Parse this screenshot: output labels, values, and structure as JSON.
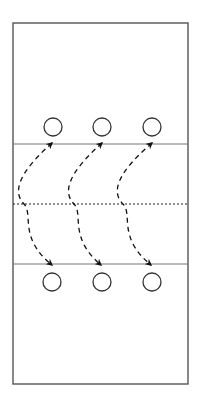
{
  "diagram": {
    "type": "volleyball-court-rotation",
    "colors": {
      "background": "#ffffff",
      "court_border": "#555555",
      "lines": "#777777",
      "net": "#222222",
      "players": "#333333",
      "arrows": "#111111"
    },
    "court": {
      "x": 13,
      "y": 23,
      "width": 175,
      "height": 361
    },
    "lines": {
      "attack_line_top_y": 144,
      "net_y": 204,
      "attack_line_bottom_y": 264
    },
    "players": {
      "radius": 9,
      "top_row": [
        {
          "cx": 53,
          "cy": 127
        },
        {
          "cx": 102,
          "cy": 127
        },
        {
          "cx": 152,
          "cy": 127
        }
      ],
      "bottom_row": [
        {
          "cx": 52,
          "cy": 282
        },
        {
          "cx": 102,
          "cy": 282
        },
        {
          "cx": 152,
          "cy": 282
        }
      ]
    },
    "arrows": [
      {
        "start": [
          52,
          143
        ],
        "bulge_x": 24,
        "end": [
          52,
          265
        ],
        "style": "dashed",
        "heads": "both"
      },
      {
        "start": [
          102,
          143
        ],
        "bulge_x": 74,
        "end": [
          101,
          265
        ],
        "style": "dashed",
        "heads": "both"
      },
      {
        "start": [
          152,
          143
        ],
        "bulge_x": 123,
        "end": [
          151,
          265
        ],
        "style": "dashed",
        "heads": "both"
      }
    ]
  }
}
